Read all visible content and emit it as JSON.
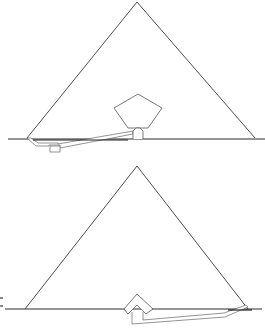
{
  "figure": {
    "colors": {
      "line": "#3a3a3a",
      "background": "#ffffff",
      "chamber_stroke": "#555555"
    }
  },
  "pyramids": [
    {
      "id": "top",
      "apex": [
        137,
        2
      ],
      "base_left": [
        27,
        138
      ],
      "base_right": [
        255,
        138
      ],
      "ground_y": 139,
      "ground_x": [
        8,
        265
      ],
      "chamber": {
        "shape": "pentagon",
        "points": [
          [
            138,
            94
          ],
          [
            162,
            108
          ],
          [
            148,
            128
          ],
          [
            128,
            128
          ],
          [
            114,
            108
          ]
        ]
      },
      "antechamber": {
        "shape": "arch",
        "x": [
          133,
          143
        ],
        "y": [
          128,
          139
        ]
      },
      "passage": {
        "type": "descending-then-ascending",
        "entry": [
          27,
          138
        ],
        "niche": [
          50,
          145,
          60,
          152
        ],
        "end": [
          133,
          133
        ]
      }
    },
    {
      "id": "bottom",
      "apex": [
        137,
        166
      ],
      "base_left": [
        25,
        309
      ],
      "base_right": [
        248,
        309
      ],
      "ground_y": 309,
      "ground_x": [
        5,
        262
      ],
      "chamber": {
        "shape": "gable",
        "points": [
          [
            137,
            294
          ],
          [
            153,
            309
          ],
          [
            146,
            313
          ],
          [
            137,
            305
          ],
          [
            128,
            313
          ],
          [
            124,
            309
          ]
        ]
      },
      "passage": {
        "type": "shaft-and-ascending-corridor",
        "start": [
          133,
          310
        ],
        "bottom_y": 324,
        "end": [
          248,
          307
        ]
      }
    }
  ],
  "side_marks": [
    {
      "x": 1,
      "y": 298,
      "label": ""
    },
    {
      "x": 1,
      "y": 306,
      "label": ""
    }
  ]
}
